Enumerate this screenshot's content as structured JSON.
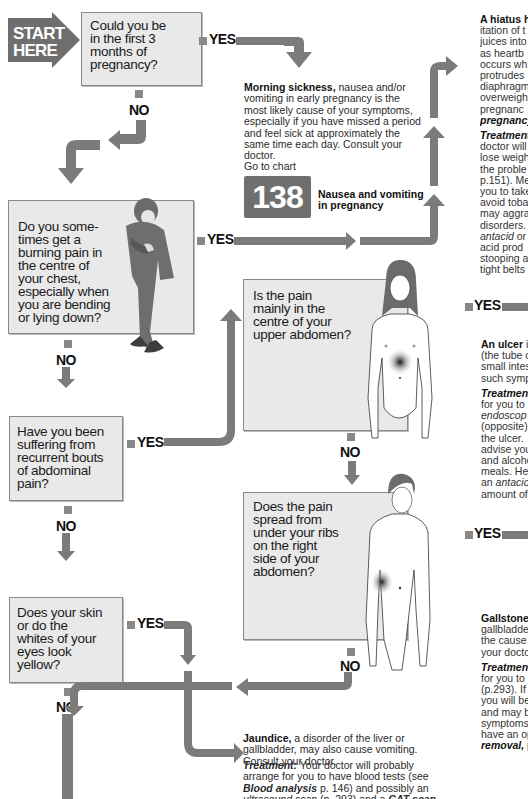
{
  "start": {
    "label": "START\nHERE"
  },
  "labels": {
    "yes": "YES",
    "no": "NO"
  },
  "questions": [
    {
      "id": "q1",
      "text": "Could you be\nin the first 3\nmonths of\npregnancy?"
    },
    {
      "id": "q2",
      "text": "Do you some-\ntimes get a\nburning pain in\nthe centre of\nyour chest,\nespecially when\nyou are bending\nor lying down?"
    },
    {
      "id": "q3",
      "text": "Have you been\nsuffering from\nrecurrent bouts\nof abdominal\npain?"
    },
    {
      "id": "q4",
      "text": "Does your skin\nor do the\nwhites of your\neyes look\nyellow?"
    },
    {
      "id": "q5",
      "text": "Is the pain\nmainly in the\ncentre of your\nupper abdomen?"
    },
    {
      "id": "q6",
      "text": "Does the pain\nspread from\nunder your ribs\non the right\nside of your\nabdomen?"
    }
  ],
  "morning_sickness": {
    "title": "Morning sickness,",
    "body": " nausea and/or vomiting in early pregnancy is the most likely cause of your symptoms, especially if you have missed a period and feel sick at approximately the same time each day. Consult your doctor.",
    "goto": "Go to chart",
    "chart_number": "138",
    "chart_title": "Nausea and vomiting\nin pregnancy"
  },
  "hiatus": {
    "lines": [
      {
        "b": "A hiatus h",
        "t": ""
      },
      {
        "b": "",
        "t": "itation of t"
      },
      {
        "b": "",
        "t": "juices into"
      },
      {
        "b": "",
        "t": "as heartb"
      },
      {
        "b": "",
        "t": "occurs wh"
      },
      {
        "b": "",
        "t": "protrudes"
      },
      {
        "b": "",
        "t": "diaphragm"
      },
      {
        "b": "",
        "t": "overweigh"
      },
      {
        "b": "",
        "t": "pregnanc"
      },
      {
        "b": "",
        "t": "",
        "i": "pregnancy"
      }
    ],
    "treatment_lines": [
      {
        "bi": "Treatment"
      },
      {
        "t": "doctor will"
      },
      {
        "t": "lose weigh"
      },
      {
        "t": "the proble"
      },
      {
        "t": "p.151). Me"
      },
      {
        "t": "you to take"
      },
      {
        "t": "avoid toba"
      },
      {
        "t": "may aggra"
      },
      {
        "t": "disorders."
      },
      {
        "i": "antacid",
        "t": " or"
      },
      {
        "t": "acid prod"
      },
      {
        "t": "stooping a"
      },
      {
        "t": "tight belts"
      }
    ]
  },
  "ulcer": {
    "lines": [
      {
        "b": "An ulcer",
        "t": " in"
      },
      {
        "t": "(the tube o"
      },
      {
        "t": "small intes"
      },
      {
        "t": "such symp"
      }
    ],
    "treatment_lines": [
      {
        "bi": "Treatmen"
      },
      {
        "t": "for you to"
      },
      {
        "i": "endoscop"
      },
      {
        "t": "(opposite)"
      },
      {
        "t": "the ulcer."
      },
      {
        "t": "advise you"
      },
      {
        "t": "and alcoho"
      },
      {
        "t": "meals. He"
      },
      {
        "t": "an ",
        "i": "antacio"
      },
      {
        "t": "amount of"
      }
    ]
  },
  "gallstones": {
    "lines": [
      {
        "b": "Gallstones"
      },
      {
        "t": "gallbladde"
      },
      {
        "t": "the cause"
      },
      {
        "t": "your docto"
      }
    ],
    "treatment_lines": [
      {
        "bi": "Treatmen"
      },
      {
        "t": "for you to"
      },
      {
        "t": "(p.293). If"
      },
      {
        "t": "you will be"
      },
      {
        "t": "and may b"
      },
      {
        "t": "symptoms"
      },
      {
        "t": "have an op"
      },
      {
        "i": "removal,",
        "t": " p"
      }
    ]
  },
  "jaundice": {
    "title": "Jaundice,",
    "body": " a disorder of the liver or gallbladder, may also cause vomiting. Consult your doctor.",
    "treatment_label": "Treatment:",
    "treatment_parts": [
      " Your doctor will probably arrange for you to have blood tests (see ",
      "Blood analysis",
      " p. 146) and possibly an ",
      "ultrasound scan",
      " (p. 293) and a ",
      "CAT scan,",
      " (p. 163) to find the cause of the"
    ]
  },
  "colors": {
    "box_fill": "#e9e9e9",
    "arrow": "#7b7b7b",
    "start": "#6e6e6e",
    "chart_badge": "#6f6f6f"
  }
}
